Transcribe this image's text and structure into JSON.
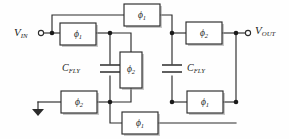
{
  "diagram": {
    "type": "circuit-schematic",
    "width": 289,
    "height": 139,
    "colors": {
      "wire": "#2b2b2b",
      "background": "#fefefe",
      "box_fill": "#ffffff",
      "node": "#1a1a1a",
      "shadow": "#9a9a9a"
    }
  },
  "terminals": [
    {
      "id": "vin",
      "label": "V",
      "sub": "IN",
      "x": 38,
      "y": 33
    },
    {
      "id": "vout",
      "label": "V",
      "sub": "OUT",
      "x": 253,
      "y": 31
    }
  ],
  "capacitors": [
    {
      "id": "cfly-left",
      "label": "C",
      "sub": "FLY",
      "label_x": 62,
      "label_y": 70
    },
    {
      "id": "cfly-right",
      "label": "C",
      "sub": "FLY",
      "label_x": 178,
      "label_y": 70
    }
  ],
  "switches": [
    {
      "id": "sw-top-center",
      "label": "ϕ",
      "sub": "1",
      "x": 124,
      "y": 4,
      "w": 36,
      "h": 22,
      "orient": "h"
    },
    {
      "id": "sw-left-in",
      "label": "ϕ",
      "sub": "1",
      "x": 60,
      "y": 23,
      "w": 36,
      "h": 22,
      "orient": "h"
    },
    {
      "id": "sw-right-out",
      "label": "ϕ",
      "sub": "2",
      "x": 186,
      "y": 22,
      "w": 36,
      "h": 22,
      "orient": "h"
    },
    {
      "id": "sw-center-vertical",
      "label": "ϕ",
      "sub": "2",
      "x": 120,
      "y": 52,
      "w": 22,
      "h": 36,
      "orient": "v"
    },
    {
      "id": "sw-bottom-left-gnd",
      "label": "ϕ",
      "sub": "2",
      "x": 61,
      "y": 91,
      "w": 36,
      "h": 22,
      "orient": "h"
    },
    {
      "id": "sw-bottom-right",
      "label": "ϕ",
      "sub": "1",
      "x": 187,
      "y": 91,
      "w": 36,
      "h": 22,
      "orient": "h"
    },
    {
      "id": "sw-bottom-center",
      "label": "ϕ",
      "sub": "1",
      "x": 122,
      "y": 112,
      "w": 36,
      "h": 22,
      "orient": "h"
    }
  ],
  "ground": {
    "id": "ground-symbol",
    "x": 38,
    "y": 102
  },
  "phases": {
    "phi1": "ϕ1",
    "phi2": "ϕ2"
  }
}
